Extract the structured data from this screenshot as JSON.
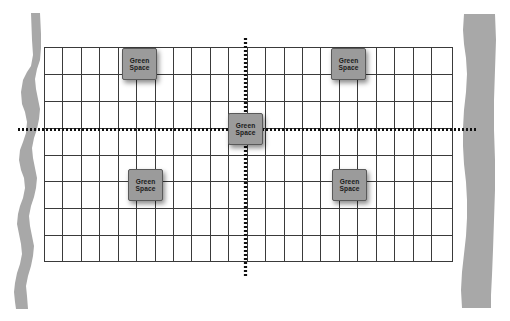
{
  "diagram": {
    "background_color": "#ffffff",
    "grid": {
      "x": 44,
      "y": 47,
      "width": 409,
      "height": 215,
      "columns": 22,
      "rows": 8,
      "line_color": "#3a3a3a",
      "line_width": 1,
      "fill_color": "#ffffff"
    },
    "axes": [
      {
        "name": "horizontal-dashed-axis",
        "orientation": "horizontal",
        "x": 18,
        "y": 129,
        "length": 460,
        "color": "#111111",
        "thickness": 3,
        "dash": "2 2"
      },
      {
        "name": "vertical-dashed-axis",
        "orientation": "vertical",
        "x": 245,
        "y": 38,
        "length": 238,
        "color": "#111111",
        "thickness": 3,
        "dash": "2 2"
      }
    ],
    "bands": [
      {
        "name": "left-boundary-band",
        "x": 14,
        "width": 24,
        "color": "#a8a8a8"
      },
      {
        "name": "right-boundary-band",
        "x": 460,
        "width": 36,
        "color": "#a8a8a8"
      }
    ],
    "green_spaces": [
      {
        "id": "green-space-top-left",
        "line1": "Green",
        "line2": "Space",
        "x": 122,
        "y": 48
      },
      {
        "id": "green-space-top-right",
        "line1": "Green",
        "line2": "Space",
        "x": 331,
        "y": 48
      },
      {
        "id": "green-space-center",
        "line1": "Green",
        "line2": "Space",
        "x": 228,
        "y": 113
      },
      {
        "id": "green-space-bottom-left",
        "line1": "Green",
        "line2": "Space",
        "x": 128,
        "y": 169
      },
      {
        "id": "green-space-bottom-right",
        "line1": "Green",
        "line2": "Space",
        "x": 332,
        "y": 169
      }
    ],
    "marker_style": {
      "fill": "#9b9b9b",
      "border": "#595959",
      "text_color": "#1a1a1a"
    }
  }
}
